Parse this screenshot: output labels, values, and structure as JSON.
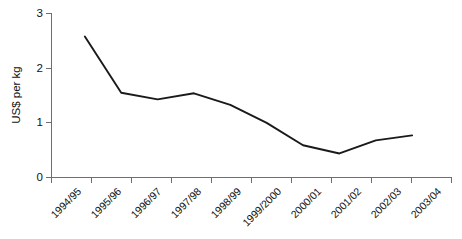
{
  "chart_data": {
    "type": "line",
    "title": "",
    "subtitle": "",
    "xlabel": "",
    "ylabel": "US$ per kg",
    "categories": [
      "1994/95",
      "1995/96",
      "1996/97",
      "1997/98",
      "1998/99",
      "1999/2000",
      "2000/01",
      "2001/02",
      "2002/03",
      "2003/04"
    ],
    "values": [
      2.58,
      1.55,
      1.43,
      1.54,
      1.33,
      1.0,
      0.59,
      0.44,
      0.68,
      0.77
    ],
    "series": [
      {
        "name": "US$ per kg",
        "values": [
          2.58,
          1.55,
          1.43,
          1.54,
          1.33,
          1.0,
          0.59,
          0.44,
          0.68,
          0.77
        ]
      }
    ],
    "ylim": [
      0,
      3
    ],
    "yticks": [
      0,
      1,
      2,
      3
    ],
    "ytick_labels": [
      "0",
      "1",
      "2",
      "3"
    ],
    "grid": false,
    "legend": false,
    "legend_position": "none",
    "line_color": "#1a1a1a",
    "axis_color": "#6e6e6e",
    "background_color": "#ffffff",
    "xtick_label_rotation": -45
  },
  "axes": {
    "y_title": "US$ per kg",
    "y_tick_labels": [
      "3",
      "2",
      "1",
      "0"
    ],
    "x_tick_labels": [
      "1994/95",
      "1995/96",
      "1996/97",
      "1997/98",
      "1998/99",
      "1999/2000",
      "2000/01",
      "2001/02",
      "2002/03",
      "2003/04"
    ]
  }
}
